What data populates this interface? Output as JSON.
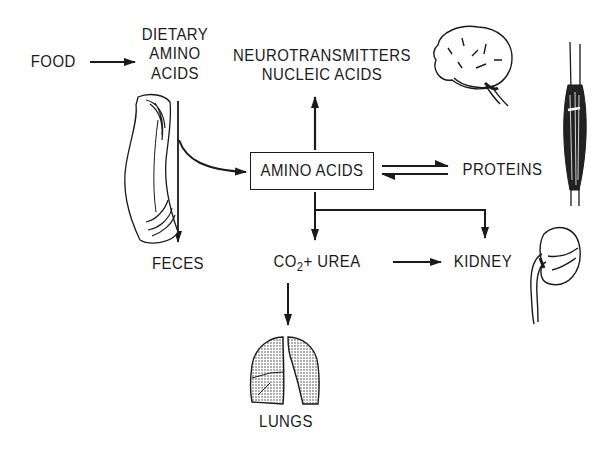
{
  "diagram": {
    "nodes": {
      "food": "FOOD",
      "dietary_amino_acids": [
        "DIETARY",
        "AMINO",
        "ACIDS"
      ],
      "neurotransmitters": "NEUROTRANSMITTERS",
      "nucleic_acids": "NUCLEIC ACIDS",
      "amino_acids": "AMINO ACIDS",
      "proteins": "PROTEINS",
      "feces": "FECES",
      "co2_prefix": "CO",
      "co2_subscript": "2",
      "urea_part": "+ UREA",
      "kidney": "KIDNEY",
      "lungs": "LUNGS"
    },
    "edges": [
      {
        "from": "FOOD",
        "to": "DIETARY AMINO ACIDS",
        "type": "arrow"
      },
      {
        "from": "DIETARY AMINO ACIDS",
        "to": "FECES",
        "type": "arrow"
      },
      {
        "from": "DIETARY AMINO ACIDS",
        "to": "AMINO ACIDS",
        "type": "curved-arrow"
      },
      {
        "from": "AMINO ACIDS",
        "to": "NEUROTRANSMITTERS / NUCLEIC ACIDS",
        "type": "arrow"
      },
      {
        "from": "AMINO ACIDS",
        "to": "PROTEINS",
        "type": "reversible"
      },
      {
        "from": "AMINO ACIDS",
        "to": "CO2 + UREA",
        "type": "arrow"
      },
      {
        "from": "AMINO ACIDS",
        "to": "KIDNEY",
        "type": "arrow"
      },
      {
        "from": "CO2 + UREA",
        "to": "KIDNEY",
        "type": "arrow"
      },
      {
        "from": "CO2 + UREA",
        "to": "LUNGS",
        "type": "arrow"
      }
    ],
    "illustrations": [
      "intestine-icon",
      "brain-icon",
      "muscle-icon",
      "kidney-icon",
      "lungs-icon"
    ],
    "colors": {
      "ink": "#1a1a1a",
      "background": "#ffffff"
    }
  }
}
